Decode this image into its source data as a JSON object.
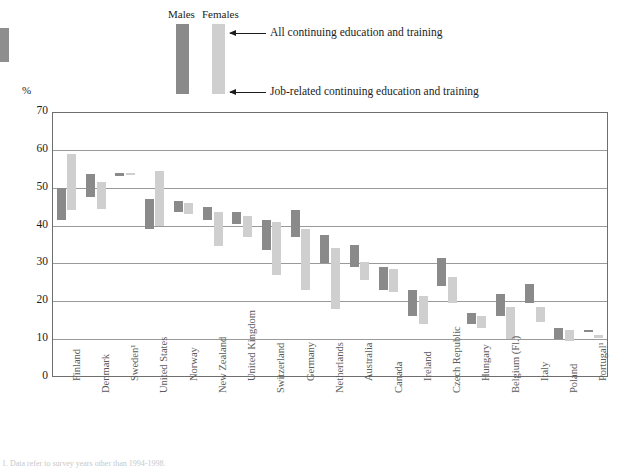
{
  "legend": {
    "males_title": "Males",
    "females_title": "Females",
    "label_all": "All continuing education and training",
    "label_job": "Job-related continuing education and training",
    "color_male": "#8a8a8a",
    "color_female": "#cfcfcf"
  },
  "axis": {
    "unit": "%",
    "ticks": [
      "70",
      "60",
      "50",
      "40",
      "30",
      "20",
      "10",
      "0"
    ]
  },
  "footnote": "1. Data refer to survey years other than 1994-1998.",
  "chart_data": {
    "type": "bar",
    "title": "",
    "subtitle": "",
    "xlabel": "",
    "ylabel": "%",
    "ylim": [
      0,
      70
    ],
    "yticks": [
      0,
      10,
      20,
      30,
      40,
      50,
      60,
      70
    ],
    "grid": true,
    "legend_position": "top",
    "note": "Floating range bars: each bar spans from the job-related continuing education and training rate (bar bottom) to the all continuing education and training rate (bar top).",
    "categories": [
      "Finland",
      "Denmark",
      "Sweden¹",
      "United States",
      "Norway",
      "New Zealand",
      "United Kingdom",
      "Switzerland",
      "Germany",
      "Netherlands",
      "Australia",
      "Canada",
      "Ireland",
      "Czech Republic",
      "Hungary",
      "Belgium (Fl.)",
      "Italy",
      "Poland",
      "Portugal¹"
    ],
    "series": [
      {
        "name": "Males",
        "color": "#8a8a8a",
        "all": [
          50.0,
          53.5,
          54.0,
          47.0,
          46.5,
          45.0,
          43.5,
          41.5,
          44.0,
          37.5,
          35.0,
          29.0,
          23.0,
          31.5,
          17.0,
          22.0,
          24.5,
          13.0,
          12.5
        ],
        "job_related": [
          41.5,
          47.5,
          53.0,
          39.0,
          43.5,
          41.5,
          40.5,
          33.5,
          37.0,
          30.0,
          29.0,
          23.0,
          16.0,
          24.0,
          14.0,
          16.0,
          19.5,
          10.0,
          12.0
        ]
      },
      {
        "name": "Females",
        "color": "#cfcfcf",
        "all": [
          59.0,
          51.5,
          54.0,
          54.5,
          46.0,
          43.5,
          42.5,
          41.0,
          39.0,
          34.0,
          30.5,
          28.5,
          21.5,
          26.5,
          16.0,
          18.5,
          18.5,
          12.5,
          11.0
        ],
        "job_related": [
          44.0,
          44.5,
          53.5,
          40.0,
          43.0,
          34.5,
          37.0,
          27.0,
          23.0,
          18.0,
          25.5,
          22.5,
          14.0,
          19.5,
          13.0,
          10.0,
          14.5,
          9.5,
          10.5
        ]
      }
    ]
  }
}
